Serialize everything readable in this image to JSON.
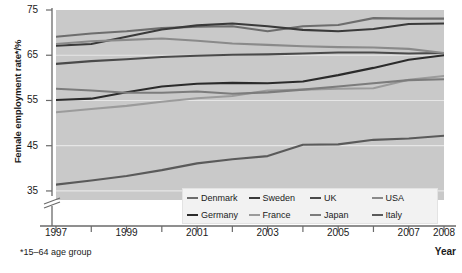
{
  "axes": {
    "ylabel": "Female employment rate*/%",
    "xlabel": "Year",
    "footnote": "*15–64 age group",
    "yticks": [
      "75",
      "65",
      "55",
      "45",
      "35"
    ],
    "xticks": [
      "1997",
      "1999",
      "2001",
      "2003",
      "2005",
      "2007",
      "2008"
    ]
  },
  "legend": {
    "items": [
      {
        "label": "Denmark",
        "color": "#6d6d6d"
      },
      {
        "label": "Sweden",
        "color": "#3a3a3a"
      },
      {
        "label": "UK",
        "color": "#4a4a4a"
      },
      {
        "label": "USA",
        "color": "#8a8a8a"
      },
      {
        "label": "Germany",
        "color": "#2b2b2b"
      },
      {
        "label": "France",
        "color": "#9b9b9b"
      },
      {
        "label": "Japan",
        "color": "#7c7c7c"
      },
      {
        "label": "Italy",
        "color": "#5a5a5a"
      }
    ]
  },
  "chart_data": {
    "type": "line",
    "title": "",
    "xlabel": "Year",
    "ylabel": "Female employment rate*/%",
    "xlim": [
      1997,
      2008
    ],
    "ylim": [
      33,
      75
    ],
    "grid": true,
    "axis_break": "below 35",
    "legend_position": "bottom-right",
    "x": [
      1997,
      1998,
      1999,
      2000,
      2001,
      2002,
      2003,
      2004,
      2005,
      2006,
      2007,
      2008
    ],
    "series": [
      {
        "name": "Denmark",
        "color": "#6d6d6d",
        "values": [
          69.1,
          69.8,
          70.3,
          71.0,
          71.3,
          71.4,
          70.3,
          71.4,
          71.7,
          73.2,
          73.1,
          73.1
        ]
      },
      {
        "name": "Sweden",
        "color": "#3a3a3a",
        "values": [
          67.1,
          67.5,
          69.1,
          70.7,
          71.6,
          72.0,
          71.4,
          70.6,
          70.3,
          70.8,
          71.9,
          72.0
        ]
      },
      {
        "name": "UK",
        "color": "#4a4a4a",
        "values": [
          63.1,
          63.7,
          64.1,
          64.6,
          64.9,
          65.1,
          65.2,
          65.4,
          65.6,
          65.6,
          65.4,
          65.5
        ]
      },
      {
        "name": "USA",
        "color": "#8a8a8a",
        "values": [
          67.5,
          68.1,
          68.4,
          68.7,
          68.2,
          67.6,
          67.3,
          67.0,
          66.8,
          66.7,
          66.4,
          65.5
        ]
      },
      {
        "name": "Germany",
        "color": "#2b2b2b",
        "values": [
          55.1,
          55.4,
          56.8,
          58.1,
          58.7,
          58.9,
          58.8,
          59.2,
          60.6,
          62.2,
          64.0,
          65.0
        ]
      },
      {
        "name": "France",
        "color": "#9b9b9b",
        "values": [
          52.4,
          53.1,
          53.8,
          54.7,
          55.5,
          56.0,
          57.2,
          57.4,
          57.6,
          57.7,
          59.6,
          60.4
        ]
      },
      {
        "name": "Japan",
        "color": "#7c7c7c",
        "values": [
          57.6,
          57.2,
          56.7,
          56.7,
          57.0,
          56.5,
          56.8,
          57.4,
          58.1,
          58.8,
          59.5,
          59.7
        ]
      },
      {
        "name": "Italy",
        "color": "#5a5a5a",
        "values": [
          36.4,
          37.3,
          38.3,
          39.6,
          41.1,
          42.0,
          42.7,
          45.2,
          45.3,
          46.3,
          46.6,
          47.2
        ]
      }
    ]
  }
}
